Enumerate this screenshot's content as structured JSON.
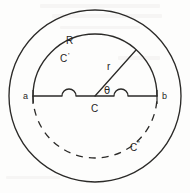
{
  "figure": {
    "stroke_color": "#2b2a28",
    "background_color": "#fdfdfc",
    "labels": {
      "region": "R",
      "outer_contour": "C",
      "inner_upper_contour": "C",
      "inner_upper_prime": "'",
      "lower_dashed_contour": "C",
      "lower_dashed_prime": "”",
      "center": "C",
      "radius": "r",
      "angle": "θ",
      "left_endpoint": "a",
      "right_endpoint": "b"
    },
    "geometry": {
      "center_x": 95,
      "center_y": 96,
      "outer_radius": 86,
      "inner_radius": 62,
      "indent_radius": 7,
      "left_indent_x": 69,
      "right_indent_x": 121,
      "radius_angle_deg": 48,
      "diameter_start_x": 33,
      "diameter_end_x": 157,
      "lower_arc_style": "dashed",
      "upper_arc_style": "solid"
    }
  }
}
